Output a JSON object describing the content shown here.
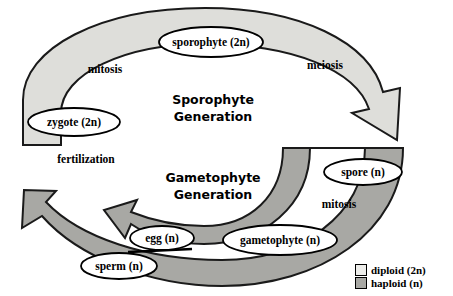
{
  "diagram": {
    "generations": [
      {
        "id": "sporophyte",
        "line1": "Sporophyte",
        "line2": "Generation"
      },
      {
        "id": "gametophyte",
        "line1": "Gametophyte",
        "line2": "Generation"
      }
    ],
    "stages": [
      {
        "id": "sporophyte",
        "label": "sporophyte (2n)",
        "ploidy": "2n",
        "cx": 211,
        "cy": 42,
        "rx": 52,
        "ry": 15
      },
      {
        "id": "zygote",
        "label": "zygote (2n)",
        "ploidy": "2n",
        "cx": 74,
        "cy": 122,
        "rx": 46,
        "ry": 14
      },
      {
        "id": "spore",
        "label": "spore (n)",
        "ploidy": "n",
        "cx": 363,
        "cy": 172,
        "rx": 39,
        "ry": 13
      },
      {
        "id": "gametophyte",
        "label": "gametophyte (n)",
        "ploidy": "n",
        "cx": 280,
        "cy": 240,
        "rx": 57,
        "ry": 15
      },
      {
        "id": "egg",
        "label": "egg (n)",
        "ploidy": "n",
        "cx": 162,
        "cy": 238,
        "rx": 32,
        "ry": 12
      },
      {
        "id": "sperm",
        "label": "sperm (n)",
        "ploidy": "n",
        "cx": 119,
        "cy": 266,
        "rx": 38,
        "ry": 13
      }
    ],
    "processes": [
      {
        "id": "mitosis-top",
        "label": "mitosis",
        "x": 105,
        "y": 70
      },
      {
        "id": "meiosis",
        "label": "meiosis",
        "x": 325,
        "y": 66
      },
      {
        "id": "fertilization",
        "label": "fertilization",
        "x": 86,
        "y": 160
      },
      {
        "id": "mitosis-bottom",
        "label": "mitosis",
        "x": 339,
        "y": 205
      }
    ],
    "legend": {
      "items": [
        {
          "id": "diploid",
          "label": "diploid (2n)",
          "color": "#ededea"
        },
        {
          "id": "haploid",
          "label": "haploid (n)",
          "color": "#a8a8a4"
        }
      ]
    },
    "colors": {
      "diploid_fill": "#dededa",
      "haploid_fill": "#a8a8a4",
      "outline": "#1a1a1a",
      "background": "#ffffff"
    }
  }
}
